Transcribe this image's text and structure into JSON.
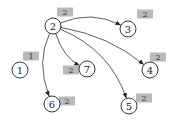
{
  "diagram": {
    "type": "directed-graph",
    "nodes": [
      {
        "id": "1",
        "label": "1",
        "badge": "1"
      },
      {
        "id": "2",
        "label": "2",
        "badge": "2"
      },
      {
        "id": "3",
        "label": "3",
        "badge": "2"
      },
      {
        "id": "4",
        "label": "4",
        "badge": "2"
      },
      {
        "id": "5",
        "label": "5",
        "badge": "2"
      },
      {
        "id": "6",
        "label": "6",
        "badge": "2"
      },
      {
        "id": "7",
        "label": "7",
        "badge": "2"
      }
    ],
    "edges": [
      {
        "from": "2",
        "to": "3"
      },
      {
        "from": "2",
        "to": "7"
      },
      {
        "from": "2",
        "to": "4"
      },
      {
        "from": "2",
        "to": "5"
      },
      {
        "from": "2",
        "to": "6"
      }
    ],
    "colors": {
      "node_stroke": "#222222",
      "edge": "#333333",
      "badge_fill": "#b9b9b9"
    }
  }
}
